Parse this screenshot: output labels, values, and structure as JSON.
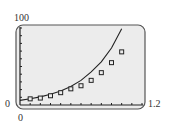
{
  "chart_data": {
    "type": "scatter",
    "title": "",
    "xlabel": "",
    "ylabel": "",
    "xlim": [
      0,
      1.2
    ],
    "ylim": [
      0,
      100
    ],
    "x_tick_step": 0.1,
    "y_tick_step": 10,
    "grid": false,
    "legend": null,
    "tick_labels": {
      "x_min": "0",
      "x_max": "1.2",
      "y_min": "0",
      "y_max": "100"
    },
    "series": [
      {
        "name": "data points",
        "type": "scatter",
        "marker": "square",
        "x": [
          0.1,
          0.2,
          0.3,
          0.4,
          0.5,
          0.6,
          0.7,
          0.8,
          0.9,
          1.0
        ],
        "y": [
          8,
          9,
          12,
          16,
          21,
          25,
          32,
          42,
          55,
          69
        ]
      },
      {
        "name": "model curve",
        "type": "line",
        "x": [
          0,
          0.1,
          0.2,
          0.3,
          0.4,
          0.5,
          0.6,
          0.7,
          0.8,
          0.9,
          1.0
        ],
        "y": [
          6,
          8,
          10.5,
          14,
          18,
          24,
          32,
          43,
          56,
          74,
          99
        ]
      }
    ]
  },
  "labels": {
    "y_max": "100",
    "y_min": "0",
    "x_min": "0",
    "x_max": "1.2"
  },
  "colors": {
    "screen_bg": "#ececec",
    "frame": "#555555",
    "ink": "#222222"
  }
}
